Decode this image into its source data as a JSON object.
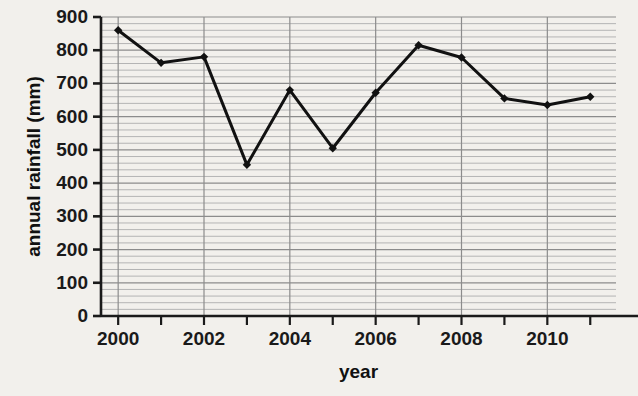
{
  "chart_data": {
    "type": "line",
    "title": "",
    "xlabel": "year",
    "ylabel": "annual rainfall (mm)",
    "x": [
      2000,
      2001,
      2002,
      2003,
      2004,
      2005,
      2006,
      2007,
      2008,
      2009,
      2010,
      2011
    ],
    "values": [
      860,
      762,
      780,
      455,
      680,
      505,
      672,
      815,
      778,
      655,
      635,
      660
    ],
    "xlim": [
      1999.6,
      2011.6
    ],
    "ylim": [
      0,
      900
    ],
    "ytick_values": [
      0,
      100,
      200,
      300,
      400,
      500,
      600,
      700,
      800,
      900
    ],
    "ytick_labels": [
      "0",
      "100",
      "200",
      "300",
      "400",
      "500",
      "600",
      "700",
      "800",
      "900"
    ],
    "xtick_values": [
      2000,
      2001,
      2002,
      2003,
      2004,
      2005,
      2006,
      2007,
      2008,
      2009,
      2010,
      2011
    ],
    "xtick_labels": [
      "2000",
      "",
      "2002",
      "",
      "2004",
      "",
      "2006",
      "",
      "2008",
      "",
      "2010",
      ""
    ],
    "grid": {
      "horizontal_major_step": 100,
      "horizontal_minor_step": 20,
      "vertical_step": 2,
      "major_color": "#8c8c8c",
      "minor_color": "#b4b4b4"
    },
    "legend": null,
    "series_color": "#111111",
    "marker": "diamond",
    "line_width": 3
  },
  "figure": {
    "background_color": "#f2f0ec",
    "plot_background_color": "#f2f0ec",
    "axis_color": "#1a1a1a"
  }
}
